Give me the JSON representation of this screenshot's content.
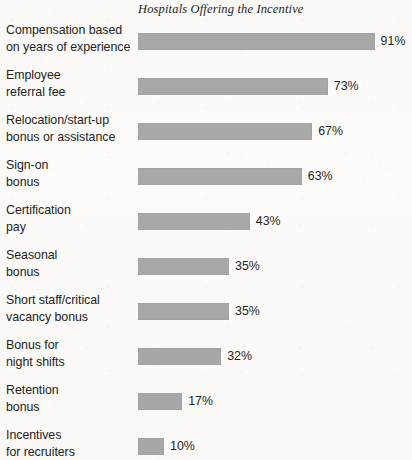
{
  "chart_data": {
    "type": "bar",
    "orientation": "horizontal",
    "title": "Hospitals Offering the Incentive",
    "xlabel": "",
    "ylabel": "",
    "xlim": [
      0,
      100
    ],
    "grid": false,
    "legend": null,
    "value_suffix": "%",
    "bar_color": "#a9a9a9",
    "background_color": "#fdfcfa",
    "text_color": "#232323",
    "categories": [
      "Compensation based on years of experience",
      "Employee referral fee",
      "Relocation/start-up bonus or assistance",
      "Sign-on bonus",
      "Certification pay",
      "Seasonal bonus",
      "Short staff/critical vacancy bonus",
      "Bonus for night shifts",
      "Retention bonus",
      "Incentives for recruiters"
    ],
    "values": [
      91,
      73,
      67,
      63,
      43,
      35,
      35,
      32,
      17,
      10
    ],
    "value_labels": [
      "91%",
      "73%",
      "67%",
      "63%",
      "43%",
      "35%",
      "35%",
      "32%",
      "17%",
      "10%"
    ],
    "rows": [
      {
        "label_line1": "Compensation based",
        "label_line2": "on years of experience",
        "value": 91,
        "value_label": "91%"
      },
      {
        "label_line1": "Employee",
        "label_line2": "referral fee",
        "value": 73,
        "value_label": "73%"
      },
      {
        "label_line1": "Relocation/start-up",
        "label_line2": "bonus or assistance",
        "value": 67,
        "value_label": "67%"
      },
      {
        "label_line1": "Sign-on",
        "label_line2": "bonus",
        "value": 63,
        "value_label": "63%"
      },
      {
        "label_line1": "Certification",
        "label_line2": "pay",
        "value": 43,
        "value_label": "43%"
      },
      {
        "label_line1": "Seasonal",
        "label_line2": "bonus",
        "value": 35,
        "value_label": "35%"
      },
      {
        "label_line1": "Short staff/critical",
        "label_line2": "vacancy bonus",
        "value": 35,
        "value_label": "35%"
      },
      {
        "label_line1": "Bonus for",
        "label_line2": "night shifts",
        "value": 32,
        "value_label": "32%"
      },
      {
        "label_line1": "Retention",
        "label_line2": "bonus",
        "value": 17,
        "value_label": "17%"
      },
      {
        "label_line1": "Incentives",
        "label_line2": "for recruiters",
        "value": 10,
        "value_label": "10%"
      }
    ]
  },
  "layout": {
    "bar_origin_x_px": 138,
    "px_per_percent": 2.6,
    "bar_height_px": 17,
    "row_pitch_px": 45,
    "value_gap_px": 6
  }
}
